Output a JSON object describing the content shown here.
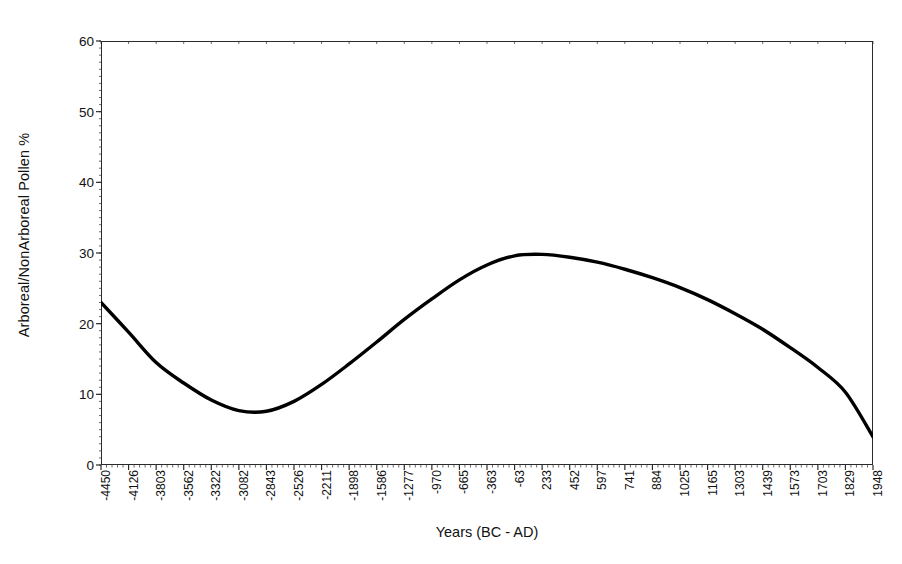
{
  "chart_data": {
    "type": "line",
    "title": "",
    "xlabel": "Years (BC - AD)",
    "ylabel": "Arboreal/NonArboreal Pollen %",
    "ylim": [
      0,
      60
    ],
    "yticks": [
      0,
      10,
      20,
      30,
      40,
      50,
      60
    ],
    "ytick_labels": [
      "0",
      "10",
      "20",
      "30",
      "40",
      "50",
      "60"
    ],
    "grid": false,
    "legend": "none",
    "line_color": "#000000",
    "line_width": 3.4,
    "categories": [
      "-4450",
      "-4126",
      "-3803",
      "-3562",
      "-3322",
      "-3082",
      "-2843",
      "-2526",
      "-2211",
      "-1898",
      "-1586",
      "-1277",
      "-970",
      "-665",
      "-363",
      "-63",
      "233",
      "452",
      "597",
      "741",
      "884",
      "1025",
      "1165",
      "1303",
      "1439",
      "1573",
      "1703",
      "1829",
      "1948"
    ],
    "values": [
      23.0,
      18.8,
      14.5,
      11.6,
      9.2,
      7.7,
      7.6,
      9.0,
      11.4,
      14.3,
      17.4,
      20.6,
      23.5,
      26.2,
      28.3,
      29.6,
      29.8,
      29.4,
      28.7,
      27.7,
      26.5,
      25.1,
      23.4,
      21.4,
      19.2,
      16.6,
      13.8,
      10.3,
      4.0
    ],
    "series": [
      {
        "name": "Arboreal/NonArboreal Pollen %",
        "values": [
          23.0,
          18.8,
          14.5,
          11.6,
          9.2,
          7.7,
          7.6,
          9.0,
          11.4,
          14.3,
          17.4,
          20.6,
          23.5,
          26.2,
          28.3,
          29.6,
          29.8,
          29.4,
          28.7,
          27.7,
          26.5,
          25.1,
          23.4,
          21.4,
          19.2,
          16.6,
          13.8,
          10.3,
          4.0
        ]
      }
    ],
    "annotations": {
      "minimum": {
        "x": "-2843",
        "y": 7.6
      },
      "maximum": {
        "x": "233",
        "y": 29.8
      },
      "start": {
        "x": "-4450",
        "y": 23.0
      },
      "end": {
        "x": "1948",
        "y": 4.0
      }
    },
    "minor_ticks_per_major": 4
  }
}
